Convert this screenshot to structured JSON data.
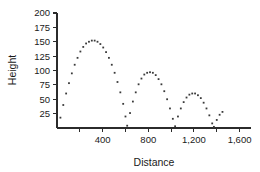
{
  "chart_data": {
    "type": "scatter",
    "title": "",
    "xlabel": "Distance",
    "ylabel": "Height",
    "xlim": [
      0,
      1700
    ],
    "ylim": [
      0,
      200
    ],
    "grid": false,
    "legend": null,
    "x_ticks": [
      0,
      200,
      400,
      600,
      800,
      1000,
      1200,
      1400,
      1600
    ],
    "x_tick_labels": [
      "",
      "",
      "400",
      "",
      "800",
      "",
      "1,200",
      "",
      "1,600"
    ],
    "y_ticks": [
      25,
      50,
      75,
      100,
      125,
      150,
      175,
      200
    ],
    "y_tick_labels": [
      "25",
      "50",
      "75",
      "100",
      "125",
      "150",
      "175",
      "200"
    ],
    "marker": "small-square-dot",
    "marker_color": "#3a3a3a",
    "series": [
      {
        "name": "Bouncing ball trajectory",
        "points": [
          [
            30,
            18
          ],
          [
            55,
            40
          ],
          [
            80,
            60
          ],
          [
            105,
            78
          ],
          [
            130,
            95
          ],
          [
            155,
            110
          ],
          [
            180,
            122
          ],
          [
            205,
            133
          ],
          [
            230,
            141
          ],
          [
            255,
            147
          ],
          [
            280,
            150
          ],
          [
            305,
            152
          ],
          [
            330,
            152
          ],
          [
            355,
            150
          ],
          [
            380,
            146
          ],
          [
            405,
            140
          ],
          [
            430,
            132
          ],
          [
            455,
            122
          ],
          [
            480,
            110
          ],
          [
            505,
            96
          ],
          [
            530,
            80
          ],
          [
            555,
            62
          ],
          [
            580,
            42
          ],
          [
            600,
            20
          ],
          [
            615,
            4
          ],
          [
            640,
            26
          ],
          [
            665,
            46
          ],
          [
            690,
            62
          ],
          [
            715,
            76
          ],
          [
            740,
            86
          ],
          [
            765,
            93
          ],
          [
            790,
            96
          ],
          [
            815,
            97
          ],
          [
            840,
            96
          ],
          [
            865,
            92
          ],
          [
            890,
            85
          ],
          [
            915,
            76
          ],
          [
            940,
            64
          ],
          [
            965,
            50
          ],
          [
            990,
            34
          ],
          [
            1015,
            16
          ],
          [
            1035,
            3
          ],
          [
            1060,
            20
          ],
          [
            1085,
            34
          ],
          [
            1110,
            45
          ],
          [
            1135,
            53
          ],
          [
            1160,
            58
          ],
          [
            1185,
            60
          ],
          [
            1210,
            60
          ],
          [
            1235,
            57
          ],
          [
            1260,
            52
          ],
          [
            1285,
            44
          ],
          [
            1310,
            34
          ],
          [
            1335,
            22
          ],
          [
            1360,
            8
          ],
          [
            1375,
            2
          ],
          [
            1400,
            14
          ],
          [
            1425,
            23
          ],
          [
            1450,
            28
          ]
        ]
      }
    ]
  },
  "figure": {
    "background_color": "#ffffff",
    "axis_color": "#2b2b2b"
  }
}
